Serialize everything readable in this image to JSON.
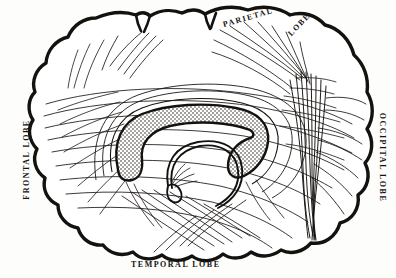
{
  "figure": {
    "kind": "anatomical-illustration",
    "background_color": "#fdfdfc",
    "ink_color": "#14120f"
  },
  "labels": {
    "parietal": "PARIETAL",
    "parietal_lobe": "LOBE",
    "frontal": "FRONTAL LOBE",
    "occipital": "OCCIPITAL LOBE",
    "temporal": "TEMPORAL LOBE"
  },
  "ghost_text": {
    "top_left": "erg\ncepen\na pro",
    "top_left_2": "odor",
    "mid_left": "n\ncases",
    "mid_left_2": "conves\ncontact",
    "bottom_left": "A 2 2 1"
  },
  "structures": {
    "outline": "cerebral-cortex-outline",
    "corpus_callosum": "stippled-crescent-band",
    "fornix": "looped-thin-arch",
    "corona_radiata": "converging-vertical-fiber-bundle",
    "association_fibers": "long-arcuate-fiber-sweeps"
  }
}
